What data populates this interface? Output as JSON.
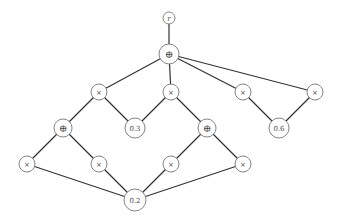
{
  "diagram": {
    "colors": {
      "edge": "#333333",
      "node_stroke": "#777777",
      "node_fill": "#ffffff",
      "label": "#444444"
    },
    "nodes": [
      {
        "id": "r",
        "label": "r",
        "kind": "var",
        "x": 169,
        "y": 18,
        "r": 6
      },
      {
        "id": "s0",
        "label": "⊕",
        "kind": "sum",
        "x": 169,
        "y": 54,
        "r": 10
      },
      {
        "id": "p1",
        "label": "×",
        "kind": "prod",
        "x": 99,
        "y": 92,
        "r": 8
      },
      {
        "id": "p2",
        "label": "×",
        "kind": "prod",
        "x": 171,
        "y": 92,
        "r": 8
      },
      {
        "id": "p3",
        "label": "×",
        "kind": "prod",
        "x": 243,
        "y": 92,
        "r": 8
      },
      {
        "id": "p4",
        "label": "×",
        "kind": "prod",
        "x": 315,
        "y": 92,
        "r": 8
      },
      {
        "id": "s1",
        "label": "⊕",
        "kind": "sum",
        "x": 63,
        "y": 128,
        "r": 9
      },
      {
        "id": "l03",
        "label": "0.3",
        "kind": "leaf",
        "x": 135,
        "y": 128,
        "r": 10
      },
      {
        "id": "s2",
        "label": "⊕",
        "kind": "sum",
        "x": 207,
        "y": 128,
        "r": 9
      },
      {
        "id": "l06",
        "label": "0.6",
        "kind": "leaf",
        "x": 279,
        "y": 128,
        "r": 10
      },
      {
        "id": "p5",
        "label": "×",
        "kind": "prod",
        "x": 27,
        "y": 164,
        "r": 8
      },
      {
        "id": "p6",
        "label": "×",
        "kind": "prod",
        "x": 99,
        "y": 164,
        "r": 8
      },
      {
        "id": "p7",
        "label": "×",
        "kind": "prod",
        "x": 171,
        "y": 164,
        "r": 8
      },
      {
        "id": "p8",
        "label": "×",
        "kind": "prod",
        "x": 243,
        "y": 164,
        "r": 8
      },
      {
        "id": "l02",
        "label": "0.2",
        "kind": "leaf",
        "x": 135,
        "y": 200,
        "r": 11
      }
    ],
    "edges": [
      [
        "r",
        "s0"
      ],
      [
        "s0",
        "p1"
      ],
      [
        "s0",
        "p2"
      ],
      [
        "s0",
        "p3"
      ],
      [
        "s0",
        "p4"
      ],
      [
        "p1",
        "s1"
      ],
      [
        "p1",
        "l03"
      ],
      [
        "p2",
        "l03"
      ],
      [
        "p2",
        "s2"
      ],
      [
        "p3",
        "l06"
      ],
      [
        "p4",
        "l06"
      ],
      [
        "s1",
        "p5"
      ],
      [
        "s1",
        "p6"
      ],
      [
        "s2",
        "p7"
      ],
      [
        "s2",
        "p8"
      ],
      [
        "p5",
        "l02"
      ],
      [
        "p6",
        "l02"
      ],
      [
        "p7",
        "l02"
      ],
      [
        "p8",
        "l02"
      ]
    ]
  }
}
